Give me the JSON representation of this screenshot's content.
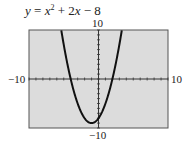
{
  "chart_data": {
    "type": "line",
    "equation": {
      "a": 1,
      "b": 2,
      "c": -8
    },
    "xlim": [
      -10,
      10
    ],
    "ylim": [
      -10,
      10
    ],
    "xscale": 1,
    "yscale": 1,
    "xlabel": "",
    "ylabel": "",
    "tick_labels": {
      "xmin": "−10",
      "xmax": "10",
      "ymin": "−10",
      "ymax": "10"
    },
    "x_intercepts": [
      -4,
      2
    ],
    "vertex": [
      -1,
      -9
    ],
    "y_intercept": -8,
    "grid": false,
    "background": "#dcdcdc",
    "curve_color": "#111111"
  },
  "title_parts": {
    "y": "y",
    "eq": " = ",
    "x1": "x",
    "sq": "2",
    "plus": " + 2",
    "x2": "x",
    "rest": " − 8"
  }
}
